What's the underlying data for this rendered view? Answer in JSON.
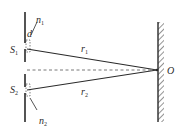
{
  "diagram": {
    "type": "double-slit interference geometry",
    "labels": {
      "slit1": {
        "main": "S",
        "sub": "1"
      },
      "slit2": {
        "main": "S",
        "sub": "2"
      },
      "separation": {
        "main": "d",
        "sub": ""
      },
      "n1": {
        "main": "n",
        "sub": "1"
      },
      "n2": {
        "main": "n",
        "sub": "2"
      },
      "r1": {
        "main": "r",
        "sub": "1"
      },
      "r2": {
        "main": "r",
        "sub": "2"
      },
      "point": {
        "main": "O",
        "sub": ""
      }
    },
    "colors": {
      "line": "#2a2a2a",
      "dashed": "#555555",
      "background": "#ffffff"
    }
  }
}
